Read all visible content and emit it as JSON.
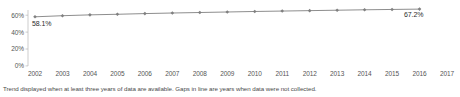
{
  "chart_data": {
    "type": "line",
    "title": "",
    "xlabel": "",
    "ylabel": "",
    "x": [
      2002,
      2003,
      2004,
      2005,
      2006,
      2007,
      2008,
      2009,
      2010,
      2011,
      2012,
      2013,
      2014,
      2015,
      2016,
      2017
    ],
    "categories": [
      "2002",
      "2003",
      "2004",
      "2005",
      "2006",
      "2007",
      "2008",
      "2009",
      "2010",
      "2011",
      "2012",
      "2013",
      "2014",
      "2015",
      "2016",
      "2017"
    ],
    "values": [
      58.1,
      59.4,
      60.4,
      61.1,
      61.9,
      62.6,
      63.2,
      63.8,
      64.4,
      64.9,
      65.4,
      65.9,
      66.4,
      66.8,
      67.2,
      null
    ],
    "ylim": [
      0,
      70
    ],
    "ytick_values": [
      0,
      20,
      40,
      60
    ],
    "ytick_labels": [
      "0%",
      "20%",
      "40%",
      "60%"
    ],
    "grid": false,
    "legend": "none",
    "series": [
      {
        "name": "trend",
        "values": [
          58.1,
          59.4,
          60.4,
          61.1,
          61.9,
          62.6,
          63.2,
          63.8,
          64.4,
          64.9,
          65.4,
          65.9,
          66.4,
          66.8,
          67.2,
          null
        ],
        "color": "#808080",
        "marker": "diamond"
      }
    ],
    "annotations": [
      {
        "name": "start-value",
        "text": "58.1%",
        "x": 2002,
        "y": 58.1
      },
      {
        "name": "end-value",
        "text": "67.2%",
        "x": 2016,
        "y": 67.2
      }
    ]
  },
  "axis": {
    "y_labels": [
      "60%",
      "40%",
      "20%",
      "0%"
    ],
    "x_labels": [
      "2002",
      "2003",
      "2004",
      "2005",
      "2006",
      "2007",
      "2008",
      "2009",
      "2010",
      "2011",
      "2012",
      "2013",
      "2014",
      "2015",
      "2016",
      "2017"
    ]
  },
  "labels": {
    "start_value": "58.1%",
    "end_value": "67.2%"
  },
  "footnote": {
    "text": "Trend displayed when at least three years of data are available. Gaps in line are years when data were not collected."
  },
  "colors": {
    "line": "#808080",
    "axis": "#b0b0b0",
    "tick_text": "#555555",
    "label_text": "#2b2b2b",
    "footnote_text": "#4a4a4a",
    "background": "#ffffff"
  }
}
